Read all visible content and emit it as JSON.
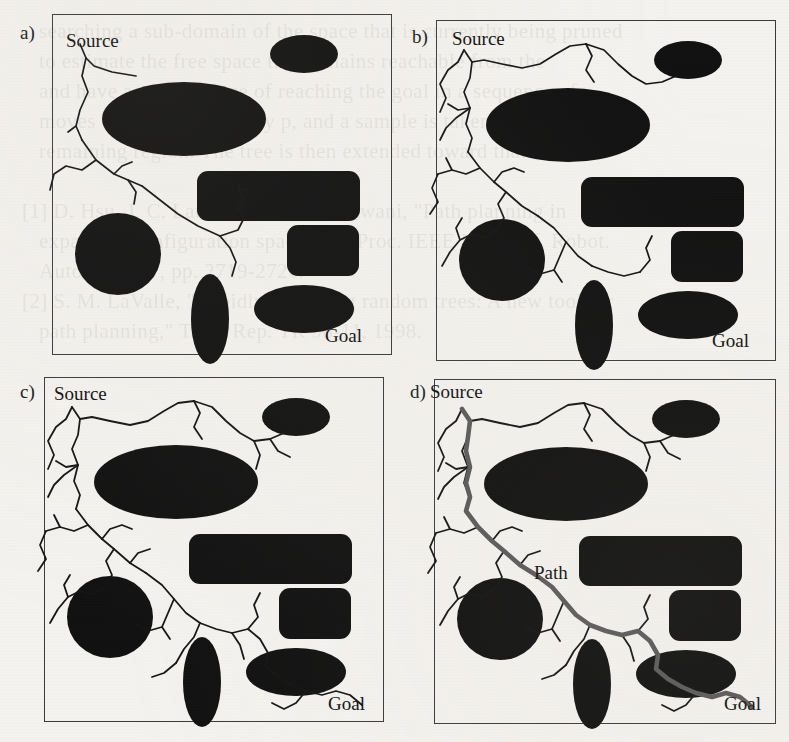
{
  "figure": {
    "background_color": "#f4f2ee",
    "ink_color": "#111111",
    "frame_color": "#3b3b3b",
    "path_color": "#5a5a5a",
    "bleed_through_text": "   searching a sub-domain of the space that is currently being pruned\n   to estimate the free space that remains reachable from the\n   and have a good chance of reaching the goal in a sequence of\n   moves with the probability p, and a sample is taken from the\n   remaining region. The tree is then extended toward that sample.\n\n[1] D. Hsu, J. C. Latombe, and R. Motwani, \"Path planning in\n   expansive configuration spaces,\" in Proc. IEEE Int. Conf. Robot.\n   Autom., 1997, pp. 2719-2726.\n[2] S. M. LaValle, \"Rapidly-exploring random trees: A new tool for\n   path planning,\" Tech. Rep. TR 98-11, 1998."
  },
  "panels": [
    {
      "id": "a",
      "label": "a)",
      "source_label": "Source",
      "goal_label": "Goal",
      "path_label": null,
      "caption_note": "early tree expansion",
      "tree_edges_drawn": 9
    },
    {
      "id": "b",
      "label": "b)",
      "source_label": "Source",
      "goal_label": "Goal",
      "path_label": null,
      "caption_note": "tree growing denser",
      "tree_edges_drawn": 24
    },
    {
      "id": "c",
      "label": "c)",
      "source_label": "Source",
      "goal_label": "Goal",
      "path_label": null,
      "caption_note": "tree reaches goal region",
      "tree_edges_drawn": 38
    },
    {
      "id": "d",
      "label": "d)",
      "source_label": "Source",
      "goal_label": "Goal",
      "path_label": "Path",
      "caption_note": "solution path highlighted",
      "tree_edges_drawn": 38
    }
  ],
  "chart_data": {
    "type": "scatter",
    "xlabel": "",
    "ylabel": "",
    "xlim": [
      0,
      340
    ],
    "ylim": [
      0,
      340
    ],
    "grid": false,
    "legend": "none",
    "obstacles": [
      {
        "name": "top-right-ellipse",
        "shape": "ellipse",
        "cx": 252,
        "cy": 40,
        "rx": 34,
        "ry": 19
      },
      {
        "name": "large-ellipse",
        "shape": "ellipse",
        "cx": 132,
        "cy": 105,
        "rx": 82,
        "ry": 37
      },
      {
        "name": "wide-rectangle",
        "shape": "rect",
        "x": 145,
        "y": 157,
        "w": 163,
        "h": 50,
        "r": 11
      },
      {
        "name": "small-rectangle",
        "shape": "rect",
        "x": 235,
        "y": 211,
        "w": 72,
        "h": 51,
        "r": 11
      },
      {
        "name": "left-circle",
        "shape": "ellipse",
        "cx": 66,
        "cy": 240,
        "rx": 43,
        "ry": 41
      },
      {
        "name": "vertical-ellipse",
        "shape": "ellipse",
        "cx": 158,
        "cy": 305,
        "rx": 19,
        "ry": 45
      },
      {
        "name": "bottom-right-ellipse",
        "shape": "ellipse",
        "cx": 252,
        "cy": 295,
        "rx": 50,
        "ry": 24
      }
    ],
    "source_point": {
      "x": 28,
      "y": 30
    },
    "goal_point": {
      "x": 312,
      "y": 330
    },
    "tree_a": [
      "M28,30 L34,44 L42,52 L60,58 L84,62",
      "M34,44 L30,62 L36,78 L28,96 L24,112 L30,126",
      "M24,112 L16,118",
      "M30,126 L44,146 L62,160 L76,166 L90,172",
      "M62,160 L70,152 L80,148",
      "M76,166 L84,178 L82,190",
      "M44,146 L30,156 L14,152 L2,160 L-2,176",
      "M90,172 L108,186 L126,200 L146,212 L168,222",
      "M168,222 L186,216 L192,204 L186,194 L192,184 L186,174",
      "M186,174 L194,176",
      "M168,222 L178,234 L184,248 L180,262"
    ],
    "tree_full": [
      "M28,30 L22,42 L12,50 L4,64 L10,78 L4,92",
      "M28,30 L36,42 L48,40 L66,44 L86,48 L104,44 L120,34 L134,26 L150,24",
      "M150,24 L168,30 L182,44 L196,56 L210,64 L226,62 L240,56",
      "M150,24 L156,36 L150,50 L158,62",
      "M36,42 L34,58 L28,72 L34,88 L30,104 L36,118 L32,132",
      "M34,88 L22,90 L12,84",
      "M34,88 L20,98 L10,108 L4,120",
      "M32,132 L44,148 L58,162 L70,172 L86,186 L102,196",
      "M58,162 L66,152 L78,148 L88,152",
      "M70,172 L62,184 L68,198 L60,210",
      "M44,148 L30,154 L16,150 L2,154",
      "M16,150 L10,138",
      "M2,154 L-4,168 L2,182 L-6,194",
      "M60,210 L48,218 L36,214 L24,220 L14,232 L6,246",
      "M24,220 L20,208 L26,198",
      "M102,196 L118,208 L130,222 L142,236 L156,246",
      "M130,222 L124,236 L118,250 L126,262",
      "M118,250 L104,254 L92,248",
      "M156,246 L172,252 L188,256 L204,252",
      "M204,252 L214,240 L210,228 L216,216",
      "M204,252 L216,262 L224,276 L222,290",
      "M156,246 L150,260 L140,272 L132,286",
      "M132,286 L120,296 L108,300",
      "M222,290 L234,300 L248,308 L262,314",
      "M262,314 L278,318 L292,314 L306,318 L318,328",
      "M262,314 L252,326 L240,332 L228,326",
      "M188,256 L196,268 L200,282",
      "M86,186 L94,176 L106,172",
      "M210,64 L216,78 L212,92",
      "M226,62 L234,74 L246,80"
    ],
    "solution_path_d": "M28,30 L36,42 L34,58 L32,72 L36,88 L32,104 L36,118 L32,132 L44,148 L58,162 L70,172 L86,186 L102,196 L118,208 L130,222 L142,236 L156,246 L172,252 L188,256 L204,252 L216,262 L224,276 L222,290 L234,300 L248,308 L262,314 L278,318 L292,314 L306,318 L318,328"
  },
  "labels": {
    "source": "Source",
    "goal": "Goal",
    "path": "Path",
    "panel_a": "a)",
    "panel_b": "b)",
    "panel_c": "c)",
    "panel_d": "d)"
  }
}
